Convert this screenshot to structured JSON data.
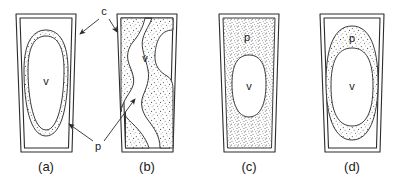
{
  "figure": {
    "background_color": "#ffffff",
    "ink_color": "#2b2b2b",
    "stipple_color": "#4a4a4a"
  },
  "labels": {
    "cell_wall": "c",
    "protoplast": "p",
    "vacuole": "v"
  },
  "panels": [
    {
      "id": "a",
      "caption": "(a)",
      "vacuole_label": "v",
      "protoplast_label": "",
      "description": "turgid cell with thin stippled peripheral protoplast and large central vacuole"
    },
    {
      "id": "b",
      "caption": "(b)",
      "vacuole_label": "v",
      "protoplast_label": "",
      "description": "plasmolysed cell with wavy scalloped protoplast strands"
    },
    {
      "id": "c",
      "caption": "(c)",
      "vacuole_label": "v",
      "protoplast_label": "p",
      "description": "cell filled with dense stippled protoplast and small central vacuole"
    },
    {
      "id": "d",
      "caption": "(d)",
      "vacuole_label": "v",
      "protoplast_label": "p",
      "description": "rounded protoplast detached from cell wall with central vacuole"
    }
  ],
  "annotations": [
    {
      "id": "c-label",
      "text": "c",
      "x": 104,
      "y": 14,
      "points_to": [
        "panel-a-wall",
        "panel-b-wall"
      ]
    },
    {
      "id": "p-label",
      "text": "p",
      "x": 98,
      "y": 146,
      "points_to": [
        "panel-a-protoplast",
        "panel-b-protoplast"
      ]
    }
  ]
}
